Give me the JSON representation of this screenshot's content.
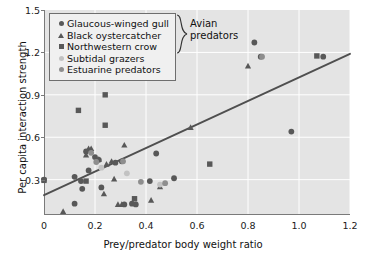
{
  "axes": {
    "xlabel": "Prey/predator body weight ratio",
    "ylabel": "Per capita interaction strength",
    "xticks": [
      "0",
      "0.2",
      "0.4",
      "0.6",
      "0.8",
      "1.0",
      "1.2"
    ],
    "yticks": [
      "0.3",
      "0.6",
      "0.9",
      "1.2",
      "1.5"
    ]
  },
  "legend": {
    "group_label_line1": "Avian",
    "group_label_line2": "predators",
    "entries": [
      {
        "label": "Glaucous-winged gull",
        "marker": "circle",
        "color": "#585858"
      },
      {
        "label": "Black oystercatcher",
        "marker": "triangle",
        "color": "#585858"
      },
      {
        "label": "Northwestern crow",
        "marker": "square",
        "color": "#585858"
      },
      {
        "label": "Subtidal grazers",
        "marker": "circle",
        "color": "#c2c2c2"
      },
      {
        "label": "Estuarine predators",
        "marker": "circle",
        "color": "#8e8e8e"
      }
    ]
  },
  "chart_data": {
    "type": "scatter",
    "title": "",
    "xlabel": "Prey/predator body weight ratio",
    "ylabel": "Per capita interaction strength",
    "xlim": [
      0,
      1.2
    ],
    "ylim": [
      0.05,
      1.5
    ],
    "grid": true,
    "legend_position": "top-left",
    "trendline": {
      "x0": 0,
      "y0": 0.19,
      "x1": 1.2,
      "y1": 1.19,
      "color": "#4f4f4f"
    },
    "series": [
      {
        "name": "Glaucous-winged gull",
        "marker": "circle",
        "color": "#585858",
        "points": [
          [
            0.0,
            0.3
          ],
          [
            0.12,
            0.13
          ],
          [
            0.12,
            0.32
          ],
          [
            0.145,
            0.29
          ],
          [
            0.15,
            0.235
          ],
          [
            0.165,
            0.5
          ],
          [
            0.175,
            0.365
          ],
          [
            0.2,
            0.46
          ],
          [
            0.215,
            0.44
          ],
          [
            0.225,
            0.245
          ],
          [
            0.28,
            0.42
          ],
          [
            0.305,
            0.43
          ],
          [
            0.315,
            0.125
          ],
          [
            0.345,
            0.13
          ],
          [
            0.36,
            0.125
          ],
          [
            0.415,
            0.29
          ],
          [
            0.44,
            0.485
          ],
          [
            0.51,
            0.31
          ],
          [
            0.825,
            1.27
          ],
          [
            0.85,
            1.17
          ],
          [
            0.97,
            0.64
          ],
          [
            1.095,
            1.17
          ]
        ]
      },
      {
        "name": "Black oystercatcher",
        "marker": "triangle",
        "color": "#585858",
        "points": [
          [
            0.075,
            0.075
          ],
          [
            0.165,
            0.475
          ],
          [
            0.175,
            0.52
          ],
          [
            0.185,
            0.52
          ],
          [
            0.215,
            0.445
          ],
          [
            0.235,
            0.2
          ],
          [
            0.245,
            0.41
          ],
          [
            0.265,
            0.43
          ],
          [
            0.275,
            0.305
          ],
          [
            0.29,
            0.125
          ],
          [
            0.305,
            0.125
          ],
          [
            0.315,
            0.545
          ],
          [
            0.42,
            0.155
          ],
          [
            0.455,
            0.25
          ],
          [
            0.575,
            0.67
          ],
          [
            0.8,
            1.105
          ]
        ]
      },
      {
        "name": "Northwestern crow",
        "marker": "square",
        "color": "#585858",
        "points": [
          [
            0.0,
            0.295
          ],
          [
            0.135,
            0.79
          ],
          [
            0.165,
            0.29
          ],
          [
            0.24,
            0.9
          ],
          [
            0.24,
            0.685
          ],
          [
            0.355,
            0.165
          ],
          [
            0.65,
            0.41
          ],
          [
            1.07,
            1.175
          ]
        ]
      },
      {
        "name": "Subtidal grazers",
        "marker": "circle",
        "color": "#c2c2c2",
        "points": [
          [
            0.225,
            0.385
          ],
          [
            0.325,
            0.345
          ],
          [
            0.455,
            0.265
          ]
        ]
      },
      {
        "name": "Estuarine predators",
        "marker": "circle",
        "color": "#8e8e8e",
        "points": [
          [
            0.185,
            0.49
          ],
          [
            0.205,
            0.425
          ],
          [
            0.31,
            0.43
          ],
          [
            0.38,
            0.285
          ],
          [
            0.475,
            0.275
          ],
          [
            0.855,
            1.17
          ]
        ]
      }
    ]
  }
}
